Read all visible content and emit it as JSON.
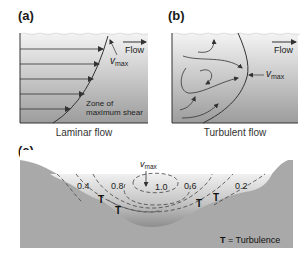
{
  "panels": {
    "a": {
      "label": "(a)",
      "caption": "Laminar flow",
      "flow_label": "Flow",
      "vmax_v": "v",
      "vmax_sub": "max",
      "zone_line1": "Zone of",
      "zone_line2": "maximum shear"
    },
    "b": {
      "label": "(b)",
      "caption": "Turbulent flow",
      "flow_label": "Flow",
      "vmax_v": "v",
      "vmax_sub": "max"
    },
    "c": {
      "label": "(c)",
      "vmax_v": "v",
      "vmax_sub": "max",
      "isovel_labels": [
        "0.4",
        "0.8",
        "1.0",
        "0.6",
        "0.2"
      ],
      "turbulence_marker": "T",
      "legend_T": "T",
      "legend_text": " = Turbulence"
    }
  },
  "colors": {
    "water_top": "#f2f2f2",
    "water_bottom": "#9a9a9a",
    "bank": "#a8a8a8",
    "line": "#333333"
  }
}
